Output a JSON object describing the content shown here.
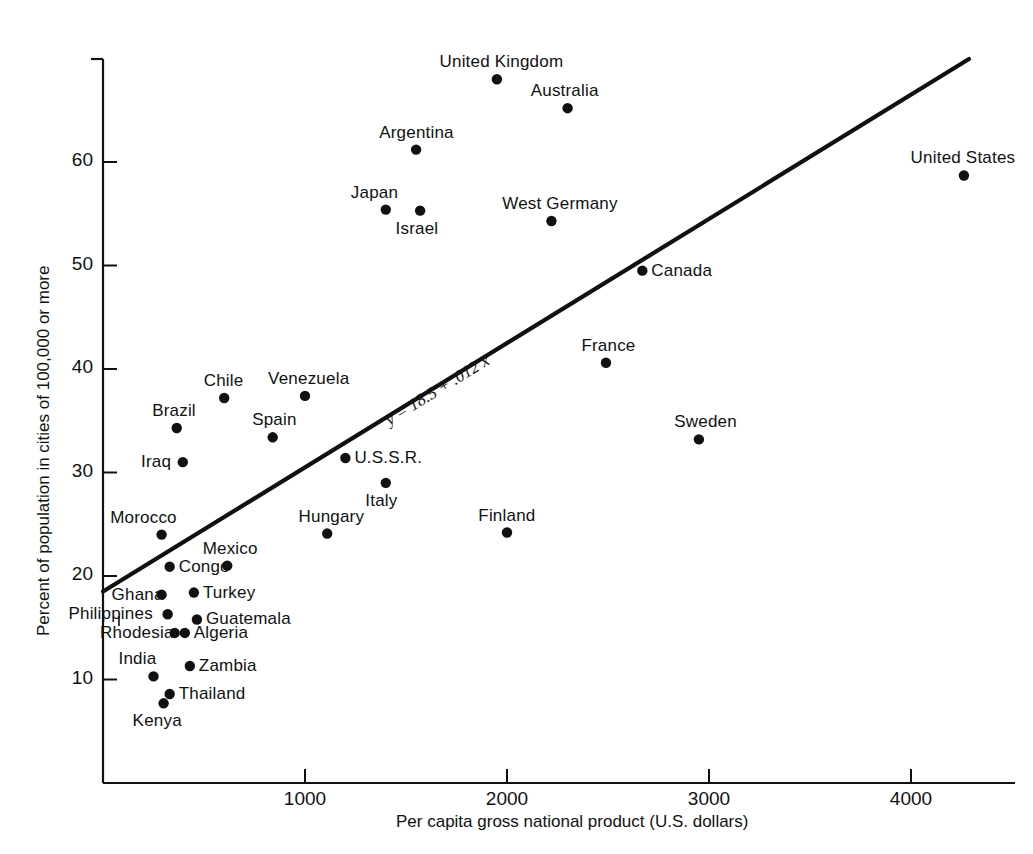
{
  "chart_data": {
    "type": "scatter",
    "title": "",
    "xlabel": "Per capita gross national product (U.S. dollars)",
    "ylabel": "Percent of population in cities of 100,000 or more",
    "xlim": [
      0,
      4450
    ],
    "ylim": [
      0,
      71
    ],
    "xticks": [
      1000,
      2000,
      3000,
      4000
    ],
    "yticks": [
      10,
      20,
      30,
      40,
      50,
      60
    ],
    "grid": false,
    "legend": null,
    "annotation": "y = 18.5 + .012 x",
    "fit_line": {
      "intercept": 18.5,
      "slope": 0.012,
      "x_start": 0,
      "x_end": 4287
    },
    "points": [
      {
        "label": "United Kingdom",
        "x": 1950,
        "y": 68.0,
        "label_pos": "above"
      },
      {
        "label": "Australia",
        "x": 2300,
        "y": 65.2,
        "label_pos": "above"
      },
      {
        "label": "Argentina",
        "x": 1550,
        "y": 61.2,
        "label_pos": "above"
      },
      {
        "label": "United States",
        "x": 4262,
        "y": 58.7,
        "label_pos": "above"
      },
      {
        "label": "Japan",
        "x": 1400,
        "y": 55.4,
        "label_pos": "above-left"
      },
      {
        "label": "Israel",
        "x": 1570,
        "y": 55.3,
        "label_pos": "below"
      },
      {
        "label": "West Germany",
        "x": 2220,
        "y": 54.3,
        "label_pos": "above"
      },
      {
        "label": "Canada",
        "x": 2670,
        "y": 49.5,
        "label_pos": "right"
      },
      {
        "label": "France",
        "x": 2490,
        "y": 40.6,
        "label_pos": "above"
      },
      {
        "label": "Venezuela",
        "x": 1000,
        "y": 37.4,
        "label_pos": "above"
      },
      {
        "label": "Chile",
        "x": 600,
        "y": 37.2,
        "label_pos": "above"
      },
      {
        "label": "Brazil",
        "x": 365,
        "y": 34.3,
        "label_pos": "above"
      },
      {
        "label": "Spain",
        "x": 840,
        "y": 33.4,
        "label_pos": "above"
      },
      {
        "label": "Sweden",
        "x": 2950,
        "y": 33.2,
        "label_pos": "above"
      },
      {
        "label": "U.S.S.R.",
        "x": 1200,
        "y": 31.4,
        "label_pos": "right"
      },
      {
        "label": "Iraq",
        "x": 395,
        "y": 31.0,
        "label_pos": "left"
      },
      {
        "label": "Italy",
        "x": 1400,
        "y": 29.0,
        "label_pos": "below"
      },
      {
        "label": "Morocco",
        "x": 290,
        "y": 24.0,
        "label_pos": "above-left"
      },
      {
        "label": "Hungary",
        "x": 1110,
        "y": 24.1,
        "label_pos": "above"
      },
      {
        "label": "Finland",
        "x": 2000,
        "y": 24.2,
        "label_pos": "above"
      },
      {
        "label": "Mexico",
        "x": 615,
        "y": 21.0,
        "label_pos": "above"
      },
      {
        "label": "Congo",
        "x": 330,
        "y": 20.9,
        "label_pos": "right"
      },
      {
        "label": "Ghana",
        "x": 290,
        "y": 18.2,
        "label_pos": "left"
      },
      {
        "label": "Turkey",
        "x": 450,
        "y": 18.4,
        "label_pos": "right"
      },
      {
        "label": "Philippines",
        "x": 320,
        "y": 16.3,
        "label_pos": "left"
      },
      {
        "label": "Guatemala",
        "x": 465,
        "y": 15.8,
        "label_pos": "right"
      },
      {
        "label": "Rhodesia",
        "x": 355,
        "y": 14.5,
        "label_pos": "left"
      },
      {
        "label": "Algeria",
        "x": 405,
        "y": 14.5,
        "label_pos": "right"
      },
      {
        "label": "Zambia",
        "x": 430,
        "y": 11.3,
        "label_pos": "right"
      },
      {
        "label": "India",
        "x": 250,
        "y": 10.3,
        "label_pos": "above-left"
      },
      {
        "label": "Thailand",
        "x": 330,
        "y": 8.6,
        "label_pos": "right"
      },
      {
        "label": "Kenya",
        "x": 300,
        "y": 7.7,
        "label_pos": "below-left"
      }
    ]
  },
  "axes": {
    "x_tick_labels": [
      "1000",
      "2000",
      "3000",
      "4000"
    ],
    "y_tick_labels": [
      "10",
      "20",
      "30",
      "40",
      "50",
      "60"
    ],
    "x_axis_title": "Per capita gross national product (U.S. dollars)",
    "y_axis_title": "Percent of population in cities of 100,000 or more"
  },
  "annotation": {
    "equation": "y = 18.5 + .012 x"
  },
  "style": {
    "axis_color": "#111111",
    "marker_color": "#111111",
    "line_color": "#111111",
    "background": "#ffffff"
  }
}
